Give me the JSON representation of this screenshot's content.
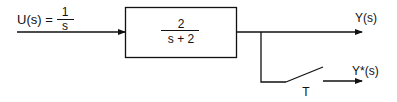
{
  "diagram": {
    "type": "block-diagram",
    "input": {
      "lhs": "U(s) =",
      "numerator": "1",
      "denominator": "s"
    },
    "block": {
      "numerator": "2",
      "denominator": "s + 2"
    },
    "outputs": {
      "continuous": "Y(s)",
      "sampled": "Y*(s)"
    },
    "sampler": {
      "period_label": "T"
    },
    "colors": {
      "line": "#111111",
      "background": "#ffffff"
    }
  }
}
